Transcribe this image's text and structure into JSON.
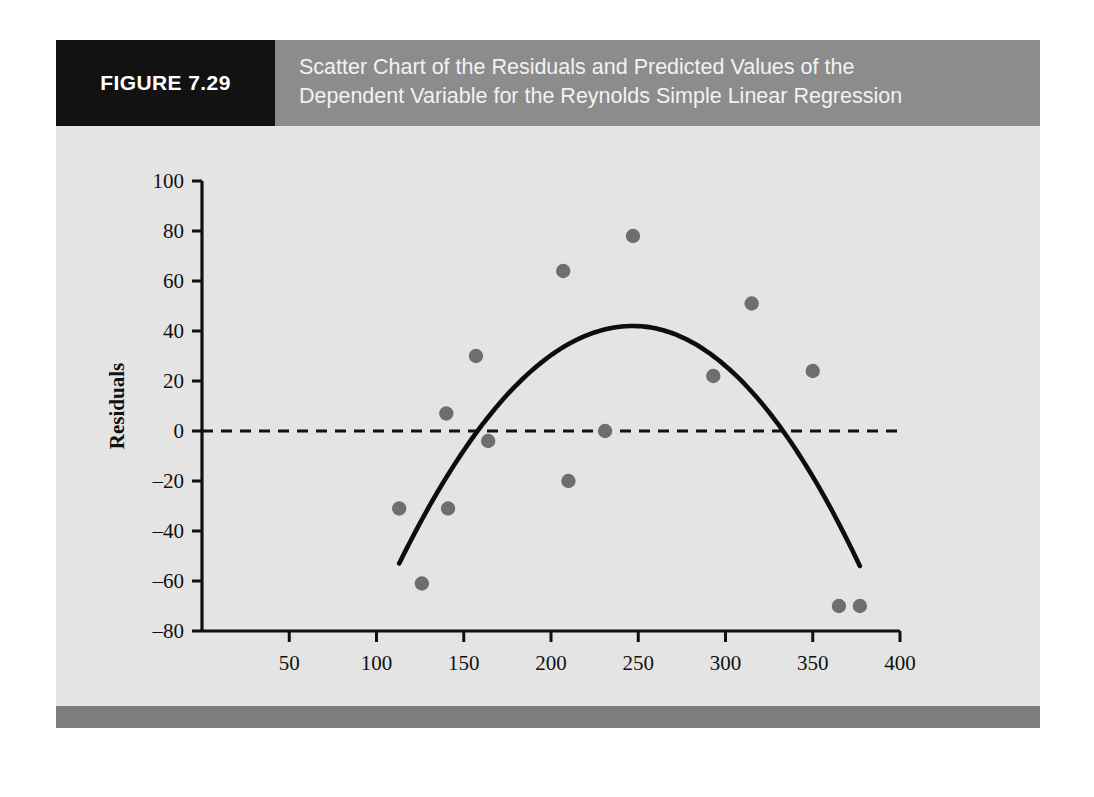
{
  "figure": {
    "tag": "FIGURE 7.29",
    "title_line1": "Scatter Chart of the Residuals and Predicted Values of the",
    "title_line2": "Dependent Variable for the Reynolds Simple Linear Regression",
    "tag_bg": "#121212",
    "header_bg": "#8c8c8c",
    "panel_bg": "#e2e2e2",
    "bottom_bar_color": "#7d7d7d"
  },
  "chart_data": {
    "type": "scatter",
    "title": "Scatter Chart of the Residuals and Predicted Values of the Dependent Variable for the Reynolds Simple Linear Regression",
    "xlabel": "Predicted Values",
    "ylabel": "Residuals",
    "xlim": [
      0,
      400
    ],
    "ylim": [
      -80,
      100
    ],
    "xticks": [
      50,
      100,
      150,
      200,
      250,
      300,
      350,
      400
    ],
    "yticks": [
      100,
      80,
      60,
      40,
      20,
      0,
      -20,
      -40,
      -60,
      -80
    ],
    "xtick_labels": [
      "50",
      "100",
      "150",
      "200",
      "250",
      "300",
      "350",
      "400"
    ],
    "ytick_labels": [
      "100",
      "80",
      "60",
      "40",
      "20",
      "0",
      "–20",
      "–40",
      "–60",
      "–80"
    ],
    "grid": false,
    "legend": "none",
    "point_color": "#6e6e6e",
    "curve_color": "#0d0d0d",
    "axis_color": "#111111",
    "zero_line": {
      "value": 0,
      "style": "dashed",
      "color": "#111111",
      "label": "zero residual reference line"
    },
    "points": [
      {
        "x": 113,
        "y": -31
      },
      {
        "x": 126,
        "y": -61
      },
      {
        "x": 140,
        "y": 7
      },
      {
        "x": 141,
        "y": -31
      },
      {
        "x": 157,
        "y": 30
      },
      {
        "x": 164,
        "y": -4
      },
      {
        "x": 207,
        "y": 64
      },
      {
        "x": 210,
        "y": -20
      },
      {
        "x": 231,
        "y": 0
      },
      {
        "x": 247,
        "y": 78
      },
      {
        "x": 293,
        "y": 22
      },
      {
        "x": 315,
        "y": 51
      },
      {
        "x": 350,
        "y": 24
      },
      {
        "x": 365,
        "y": -70
      },
      {
        "x": 377,
        "y": -70
      }
    ],
    "fitted_curve": {
      "name": "quadratic trend",
      "type": "quadratic",
      "x_start": 113,
      "x_end": 377,
      "vertex_x": 247,
      "vertex_y": 42,
      "y_start": -53,
      "y_end": -54
    }
  }
}
